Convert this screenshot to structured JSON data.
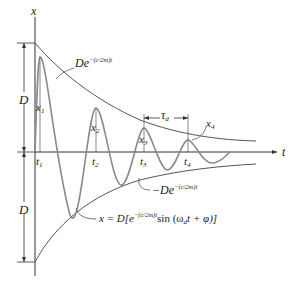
{
  "diagram": {
    "axes": {
      "vertical": "x",
      "horizontal": "t"
    },
    "amplitude_label": "D",
    "envelope_upper": {
      "base": "De",
      "exponent": "−(c/2m)t"
    },
    "envelope_lower": {
      "base": "−De",
      "exponent": "−(c/2m)t"
    },
    "response_equation": {
      "lhs": "x = D[e",
      "exponent": "−(c/2m)t",
      "rhs_a": "sin (ω",
      "rhs_sub": "d",
      "rhs_b": "t + φ)]"
    },
    "period_label": {
      "symbol": "τ",
      "sub": "d"
    },
    "peaks": [
      {
        "label": "x",
        "sub": "1"
      },
      {
        "label": "x",
        "sub": "2"
      },
      {
        "label": "x",
        "sub": "3"
      },
      {
        "label": "x",
        "sub": "4"
      }
    ],
    "times": [
      {
        "label": "t",
        "sub": "1"
      },
      {
        "label": "t",
        "sub": "2"
      },
      {
        "label": "t",
        "sub": "3"
      },
      {
        "label": "t",
        "sub": "4"
      }
    ],
    "colors": {
      "axis": "#333333",
      "envelope": "#555555",
      "response": "#8a8a8a"
    }
  }
}
